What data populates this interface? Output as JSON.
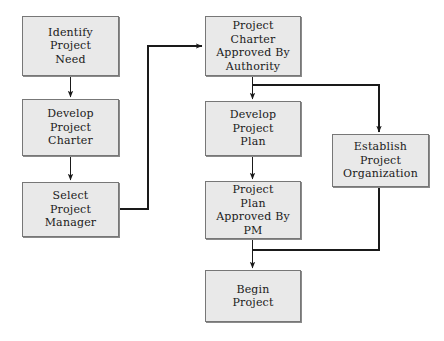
{
  "diagram": {
    "type": "flowchart",
    "canvas": {
      "width": 444,
      "height": 341,
      "background": "#ffffff"
    },
    "style": {
      "node_fill": "#e9e9e9",
      "node_border": "#777777",
      "node_shadow": "#8a8a8a",
      "edge_color": "#1a1a1a",
      "text_color": "#1a1a1a"
    },
    "nodes": [
      {
        "id": "identify-project-need",
        "label": "Identify\nProject\nNeed",
        "x": 22,
        "y": 16,
        "w": 97,
        "h": 60
      },
      {
        "id": "develop-project-charter",
        "label": "Develop\nProject\nCharter",
        "x": 22,
        "y": 99,
        "w": 97,
        "h": 57
      },
      {
        "id": "select-project-manager",
        "label": "Select\nProject\nManager",
        "x": 22,
        "y": 182,
        "w": 97,
        "h": 55
      },
      {
        "id": "project-charter-approved-by-authority",
        "label": "Project\nCharter\nApproved By\nAuthority",
        "x": 205,
        "y": 16,
        "w": 96,
        "h": 60
      },
      {
        "id": "develop-project-plan",
        "label": "Develop\nProject\nPlan",
        "x": 205,
        "y": 101,
        "w": 96,
        "h": 55
      },
      {
        "id": "project-plan-approved-by-pm",
        "label": "Project\nPlan\nApproved By\nPM",
        "x": 205,
        "y": 181,
        "w": 96,
        "h": 58
      },
      {
        "id": "begin-project",
        "label": "Begin\nProject",
        "x": 205,
        "y": 270,
        "w": 96,
        "h": 52
      },
      {
        "id": "establish-project-organization",
        "label": "Establish\nProject\nOrganization",
        "x": 332,
        "y": 134,
        "w": 97,
        "h": 53
      }
    ],
    "edges": [
      {
        "id": "edge-identify-to-develop-charter",
        "from": "identify-project-need",
        "to": "develop-project-charter",
        "arrow": true
      },
      {
        "id": "edge-develop-charter-to-select-pm",
        "from": "develop-project-charter",
        "to": "select-project-manager",
        "arrow": true
      },
      {
        "id": "edge-select-pm-to-charter-approved",
        "from": "select-project-manager",
        "to": "project-charter-approved-by-authority",
        "arrow": true
      },
      {
        "id": "edge-charter-approved-to-develop-plan",
        "from": "project-charter-approved-by-authority",
        "to": "develop-project-plan",
        "arrow": true
      },
      {
        "id": "edge-charter-approved-to-establish-org",
        "from": "project-charter-approved-by-authority",
        "to": "establish-project-organization",
        "arrow": true
      },
      {
        "id": "edge-develop-plan-to-plan-approved",
        "from": "develop-project-plan",
        "to": "project-plan-approved-by-pm",
        "arrow": true
      },
      {
        "id": "edge-plan-approved-to-begin-project",
        "from": "project-plan-approved-by-pm",
        "to": "begin-project",
        "arrow": true
      },
      {
        "id": "edge-establish-org-to-begin-project",
        "from": "establish-project-organization",
        "to": "begin-project",
        "arrow": false
      }
    ]
  }
}
